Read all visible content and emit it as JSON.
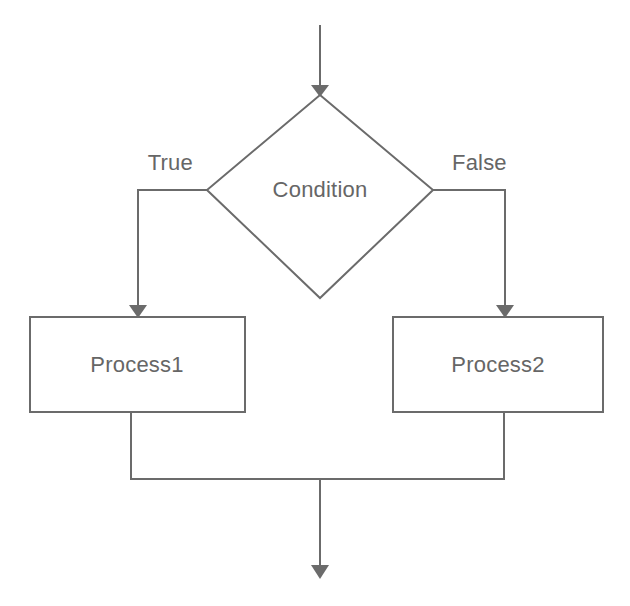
{
  "diagram": {
    "type": "flowchart",
    "background_color": "#ffffff",
    "stroke_color": "#6b6b6b",
    "text_color": "#666666",
    "nodes": [
      {
        "id": "condition",
        "shape": "diamond",
        "label": "Condition",
        "center_x": 320,
        "center_y": 196
      },
      {
        "id": "process1",
        "shape": "rectangle",
        "label": "Process1",
        "center_x": 137,
        "center_y": 364
      },
      {
        "id": "process2",
        "shape": "rectangle",
        "label": "Process2",
        "center_x": 498,
        "center_y": 364
      }
    ],
    "edges": [
      {
        "id": "entry",
        "from": "start",
        "to": "condition",
        "label": "",
        "arrow": true
      },
      {
        "id": "true-branch",
        "from": "condition",
        "to": "process1",
        "label": "True",
        "arrow": true
      },
      {
        "id": "false-branch",
        "from": "condition",
        "to": "process2",
        "label": "False",
        "arrow": true
      },
      {
        "id": "merge-left",
        "from": "process1",
        "to": "merge",
        "label": "",
        "arrow": false
      },
      {
        "id": "merge-right",
        "from": "process2",
        "to": "merge",
        "label": "",
        "arrow": false
      },
      {
        "id": "exit",
        "from": "merge",
        "to": "end",
        "label": "",
        "arrow": true
      }
    ],
    "labels": {
      "condition": "Condition",
      "process1": "Process1",
      "process2": "Process2",
      "true_branch": "True",
      "false_branch": "False"
    }
  }
}
